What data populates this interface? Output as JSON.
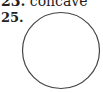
{
  "previous_item": {
    "number": "23.",
    "answer": "concave"
  },
  "current_item": {
    "number": "25.",
    "figure": {
      "shape": "circle",
      "stroke_color": "#444444",
      "fill_color": "#ffffff"
    }
  }
}
